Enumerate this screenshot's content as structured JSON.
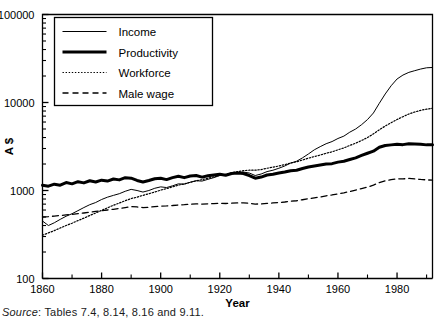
{
  "chart_data": {
    "type": "line",
    "title": "",
    "xlabel": "Year",
    "ylabel": "A $",
    "yscale": "log",
    "ylim": [
      100,
      100000
    ],
    "xlim": [
      1860,
      1992
    ],
    "grid": false,
    "legend_position": "top-left",
    "ytick_labels": [
      "100",
      "1000",
      "10000",
      "100000"
    ],
    "ytick_values": [
      100,
      1000,
      10000,
      100000
    ],
    "xtick_labels": [
      "1860",
      "1880",
      "1900",
      "1920",
      "1940",
      "1960",
      "1980"
    ],
    "xtick_values": [
      1860,
      1880,
      1900,
      1920,
      1940,
      1960,
      1980
    ],
    "xminor_ticks": [
      1870,
      1890,
      1910,
      1930,
      1950,
      1970,
      1990
    ],
    "series": [
      {
        "name": "Income",
        "style": "solid-thin",
        "x": [
          1860,
          1862,
          1864,
          1866,
          1868,
          1870,
          1872,
          1874,
          1876,
          1878,
          1880,
          1882,
          1884,
          1886,
          1888,
          1890,
          1892,
          1894,
          1896,
          1898,
          1900,
          1902,
          1904,
          1906,
          1908,
          1910,
          1912,
          1914,
          1916,
          1918,
          1920,
          1922,
          1924,
          1926,
          1928,
          1930,
          1932,
          1934,
          1936,
          1938,
          1940,
          1942,
          1944,
          1946,
          1948,
          1950,
          1952,
          1954,
          1956,
          1958,
          1960,
          1962,
          1964,
          1966,
          1968,
          1970,
          1972,
          1974,
          1976,
          1978,
          1980,
          1982,
          1984,
          1986,
          1988,
          1990,
          1992
        ],
        "values": [
          450,
          400,
          430,
          470,
          510,
          545,
          590,
          640,
          690,
          730,
          790,
          840,
          880,
          920,
          980,
          1030,
          1000,
          960,
          1000,
          1060,
          1100,
          1080,
          1130,
          1190,
          1180,
          1240,
          1290,
          1280,
          1340,
          1400,
          1480,
          1490,
          1560,
          1600,
          1620,
          1580,
          1480,
          1540,
          1640,
          1700,
          1790,
          1900,
          2050,
          2150,
          2350,
          2600,
          2900,
          3150,
          3400,
          3600,
          3900,
          4150,
          4600,
          5000,
          5600,
          6400,
          7600,
          9800,
          12500,
          15500,
          18500,
          20500,
          22000,
          23000,
          24000,
          24800,
          25000
        ]
      },
      {
        "name": "Productivity",
        "style": "solid-thick",
        "x": [
          1860,
          1862,
          1864,
          1866,
          1868,
          1870,
          1872,
          1874,
          1876,
          1878,
          1880,
          1882,
          1884,
          1886,
          1888,
          1890,
          1892,
          1894,
          1896,
          1898,
          1900,
          1902,
          1904,
          1906,
          1908,
          1910,
          1912,
          1914,
          1916,
          1918,
          1920,
          1922,
          1924,
          1926,
          1928,
          1930,
          1932,
          1934,
          1936,
          1938,
          1940,
          1942,
          1944,
          1946,
          1948,
          1950,
          1952,
          1954,
          1956,
          1958,
          1960,
          1962,
          1964,
          1966,
          1968,
          1970,
          1972,
          1974,
          1976,
          1978,
          1980,
          1982,
          1984,
          1986,
          1988,
          1990,
          1992
        ],
        "values": [
          1150,
          1120,
          1180,
          1150,
          1230,
          1190,
          1260,
          1220,
          1290,
          1250,
          1310,
          1280,
          1350,
          1320,
          1400,
          1380,
          1300,
          1250,
          1300,
          1360,
          1380,
          1330,
          1400,
          1450,
          1400,
          1460,
          1480,
          1420,
          1470,
          1500,
          1530,
          1490,
          1560,
          1580,
          1560,
          1480,
          1380,
          1420,
          1500,
          1530,
          1580,
          1620,
          1680,
          1700,
          1780,
          1850,
          1900,
          1950,
          2000,
          2020,
          2100,
          2150,
          2250,
          2350,
          2500,
          2650,
          2800,
          3100,
          3250,
          3300,
          3350,
          3320,
          3400,
          3380,
          3350,
          3300,
          3300
        ]
      },
      {
        "name": "Workforce",
        "style": "dotted",
        "x": [
          1860,
          1862,
          1864,
          1866,
          1868,
          1870,
          1872,
          1874,
          1876,
          1878,
          1880,
          1882,
          1884,
          1886,
          1888,
          1890,
          1892,
          1894,
          1896,
          1898,
          1900,
          1902,
          1904,
          1906,
          1908,
          1910,
          1912,
          1914,
          1916,
          1918,
          1920,
          1922,
          1924,
          1926,
          1928,
          1930,
          1932,
          1934,
          1936,
          1938,
          1940,
          1942,
          1944,
          1946,
          1948,
          1950,
          1952,
          1954,
          1956,
          1958,
          1960,
          1962,
          1964,
          1966,
          1968,
          1970,
          1972,
          1974,
          1976,
          1978,
          1980,
          1982,
          1984,
          1986,
          1988,
          1990,
          1992
        ],
        "values": [
          310,
          330,
          350,
          375,
          400,
          425,
          455,
          485,
          520,
          555,
          595,
          635,
          680,
          720,
          765,
          810,
          840,
          880,
          920,
          960,
          1010,
          1050,
          1100,
          1150,
          1190,
          1240,
          1290,
          1330,
          1380,
          1430,
          1490,
          1530,
          1590,
          1640,
          1680,
          1700,
          1700,
          1730,
          1790,
          1840,
          1900,
          1970,
          2050,
          2120,
          2220,
          2330,
          2430,
          2530,
          2650,
          2750,
          2900,
          3050,
          3250,
          3450,
          3700,
          4000,
          4400,
          4900,
          5400,
          5900,
          6400,
          6900,
          7400,
          7800,
          8150,
          8400,
          8600
        ]
      },
      {
        "name": "Male wage",
        "style": "dashed",
        "x": [
          1860,
          1862,
          1864,
          1866,
          1868,
          1870,
          1872,
          1874,
          1876,
          1878,
          1880,
          1882,
          1884,
          1886,
          1888,
          1890,
          1892,
          1894,
          1896,
          1898,
          1900,
          1902,
          1904,
          1906,
          1908,
          1910,
          1912,
          1914,
          1916,
          1918,
          1920,
          1922,
          1924,
          1926,
          1928,
          1930,
          1932,
          1934,
          1936,
          1938,
          1940,
          1942,
          1944,
          1946,
          1948,
          1950,
          1952,
          1954,
          1956,
          1958,
          1960,
          1962,
          1964,
          1966,
          1968,
          1970,
          1972,
          1974,
          1976,
          1978,
          1980,
          1982,
          1984,
          1986,
          1988,
          1990,
          1992
        ],
        "values": [
          500,
          505,
          512,
          520,
          528,
          536,
          545,
          555,
          566,
          578,
          590,
          600,
          612,
          625,
          640,
          655,
          650,
          640,
          645,
          655,
          665,
          668,
          675,
          685,
          690,
          698,
          705,
          700,
          705,
          710,
          715,
          712,
          718,
          722,
          725,
          715,
          700,
          705,
          715,
          722,
          730,
          740,
          755,
          765,
          785,
          805,
          825,
          845,
          870,
          890,
          915,
          940,
          975,
          1010,
          1050,
          1095,
          1150,
          1230,
          1290,
          1330,
          1360,
          1355,
          1370,
          1355,
          1335,
          1320,
          1310
        ]
      }
    ]
  },
  "legend": {
    "items": [
      {
        "label": "Income",
        "style": "solid-thin"
      },
      {
        "label": "Productivity",
        "style": "solid-thick"
      },
      {
        "label": "Workforce",
        "style": "dotted"
      },
      {
        "label": "Male wage",
        "style": "dashed"
      }
    ]
  },
  "source": {
    "label": "Source",
    "text": ": Tables 7.4, 8.14, 8.16 and 9.11."
  },
  "colors": {
    "line": "#000000",
    "axis": "#000000",
    "background": "#ffffff",
    "text": "#000000"
  }
}
